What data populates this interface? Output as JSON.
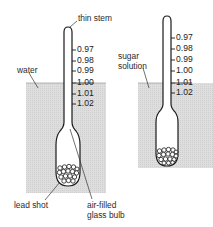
{
  "diagram": {
    "type": "hydrometer-comparison",
    "colors": {
      "liquid": "#dcdcdc",
      "outline": "#1a1a1a",
      "text": "#2a2a2a",
      "bulb_fill": "#ffffff"
    },
    "left_hydrometer": {
      "liquid_label": "water",
      "reading_at_surface": "1.00",
      "scale": [
        "0.97",
        "0.98",
        "0.99",
        "1.00",
        "1.01",
        "1.02"
      ],
      "labels": {
        "stem": "thin stem",
        "weight": "lead shot",
        "bulb_line1": "air-filled",
        "bulb_line2": "glass bulb"
      }
    },
    "right_hydrometer": {
      "liquid_label_line1": "sugar",
      "liquid_label_line2": "solution",
      "reading_at_surface": "1.01",
      "scale": [
        "0.97",
        "0.98",
        "0.99",
        "1.00",
        "1.01",
        "1.02"
      ]
    }
  }
}
